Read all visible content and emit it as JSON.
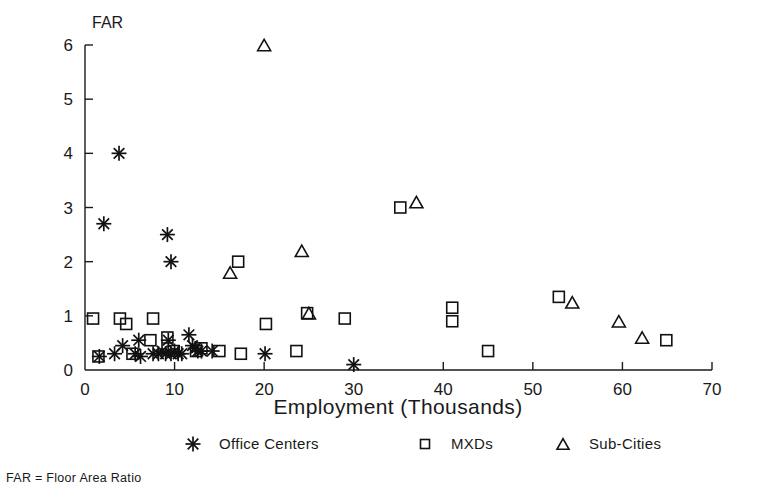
{
  "chart_data": {
    "type": "scatter",
    "title": "",
    "xlabel": "Employment (Thousands)",
    "ylabel": "FAR",
    "xlim": [
      0,
      70
    ],
    "ylim": [
      0,
      6
    ],
    "xticks": [
      0,
      10,
      20,
      30,
      40,
      50,
      60,
      70
    ],
    "yticks": [
      0,
      1,
      2,
      3,
      4,
      5,
      6
    ],
    "grid": false,
    "legend_position": "below-axis",
    "footnote": "FAR = Floor Area Ratio",
    "series": [
      {
        "name": "Office Centers",
        "marker": "asterisk",
        "points": [
          [
            1.6,
            0.25
          ],
          [
            3.3,
            0.3
          ],
          [
            4.2,
            0.45
          ],
          [
            5.6,
            0.3
          ],
          [
            6.0,
            0.55
          ],
          [
            6.2,
            0.25
          ],
          [
            7.6,
            0.3
          ],
          [
            8.2,
            0.3
          ],
          [
            8.6,
            0.35
          ],
          [
            9.0,
            0.3
          ],
          [
            9.3,
            0.55
          ],
          [
            9.6,
            0.3
          ],
          [
            10.0,
            0.35
          ],
          [
            10.4,
            0.3
          ],
          [
            10.8,
            0.3
          ],
          [
            11.6,
            0.65
          ],
          [
            12.0,
            0.45
          ],
          [
            12.3,
            0.4
          ],
          [
            12.6,
            0.35
          ],
          [
            13.0,
            0.35
          ],
          [
            14.2,
            0.35
          ],
          [
            20.1,
            0.3
          ],
          [
            30.0,
            0.1
          ],
          [
            3.8,
            4.0
          ],
          [
            2.1,
            2.7
          ],
          [
            9.2,
            2.5
          ],
          [
            9.6,
            2.0
          ]
        ]
      },
      {
        "name": "MXDs",
        "marker": "square",
        "points": [
          [
            0.9,
            0.95
          ],
          [
            1.5,
            0.25
          ],
          [
            3.9,
            0.95
          ],
          [
            4.6,
            0.85
          ],
          [
            5.3,
            0.3
          ],
          [
            7.6,
            0.95
          ],
          [
            7.3,
            0.55
          ],
          [
            9.2,
            0.6
          ],
          [
            9.9,
            0.35
          ],
          [
            12.4,
            0.35
          ],
          [
            13.0,
            0.4
          ],
          [
            15.0,
            0.35
          ],
          [
            17.4,
            0.3
          ],
          [
            17.1,
            2.0
          ],
          [
            20.2,
            0.85
          ],
          [
            23.6,
            0.35
          ],
          [
            24.8,
            1.05
          ],
          [
            29.0,
            0.95
          ],
          [
            35.2,
            3.0
          ],
          [
            41.0,
            1.15
          ],
          [
            41.0,
            0.9
          ],
          [
            45.0,
            0.35
          ],
          [
            52.9,
            1.35
          ],
          [
            64.9,
            0.55
          ]
        ]
      },
      {
        "name": "Sub-Cities",
        "marker": "triangle",
        "points": [
          [
            20.0,
            6.0
          ],
          [
            37.0,
            3.1
          ],
          [
            24.2,
            2.2
          ],
          [
            16.2,
            1.8
          ],
          [
            25.0,
            1.05
          ],
          [
            54.4,
            1.25
          ],
          [
            59.6,
            0.9
          ],
          [
            62.2,
            0.6
          ]
        ]
      }
    ]
  },
  "legend": {
    "items": [
      {
        "label": "Office Centers",
        "marker": "asterisk"
      },
      {
        "label": "MXDs",
        "marker": "square"
      },
      {
        "label": "Sub-Cities",
        "marker": "triangle"
      }
    ]
  }
}
